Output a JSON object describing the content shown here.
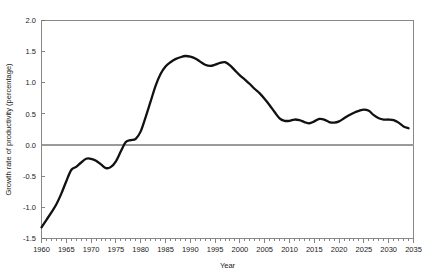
{
  "chart_data": {
    "type": "line",
    "title": "",
    "xlabel": "Year",
    "ylabel": "Growth rate of productivity (percentage)",
    "xlim": [
      1960,
      2035
    ],
    "ylim": [
      -1.5,
      2.0
    ],
    "grid": false,
    "legend": null,
    "xticks": [
      1960,
      1965,
      1970,
      1975,
      1980,
      1985,
      1990,
      1995,
      2000,
      2005,
      2010,
      2015,
      2020,
      2025,
      2030,
      2035
    ],
    "xtick_labels": [
      "1960",
      "1965",
      "1970",
      "1975",
      "1980",
      "1985",
      "1990",
      "1995",
      "2000",
      "2005",
      "2010",
      "2015",
      "2020",
      "2025",
      "2030",
      "2035"
    ],
    "xtick_minor_step": 1,
    "yticks": [
      -1.5,
      -1.0,
      -0.5,
      0.0,
      0.5,
      1.0,
      1.5,
      2.0
    ],
    "ytick_labels": [
      "-1.5",
      "-1.0",
      "-0.5",
      "0.0",
      "0.5",
      "1.0",
      "1.5",
      "2.0"
    ],
    "zero_reference_line": 0.0,
    "line_color": "#111111",
    "series": [
      {
        "name": "Growth rate of productivity",
        "x": [
          1960,
          1961,
          1962,
          1963,
          1964,
          1965,
          1966,
          1967,
          1968,
          1969,
          1970,
          1971,
          1972,
          1973,
          1974,
          1975,
          1976,
          1977,
          1978,
          1979,
          1980,
          1981,
          1982,
          1983,
          1984,
          1985,
          1986,
          1987,
          1988,
          1989,
          1990,
          1991,
          1992,
          1993,
          1994,
          1995,
          1996,
          1997,
          1998,
          1999,
          2000,
          2001,
          2002,
          2003,
          2004,
          2005,
          2006,
          2007,
          2008,
          2009,
          2010,
          2011,
          2012,
          2013,
          2014,
          2015,
          2016,
          2017,
          2018,
          2019,
          2020,
          2021,
          2022,
          2023,
          2024,
          2025,
          2026,
          2027,
          2028,
          2029,
          2030,
          2031,
          2032,
          2033,
          2034
        ],
        "values": [
          -1.32,
          -1.2,
          -1.08,
          -0.95,
          -0.78,
          -0.58,
          -0.4,
          -0.35,
          -0.28,
          -0.22,
          -0.22,
          -0.25,
          -0.31,
          -0.37,
          -0.35,
          -0.26,
          -0.1,
          0.05,
          0.08,
          0.1,
          0.22,
          0.45,
          0.7,
          0.95,
          1.14,
          1.26,
          1.33,
          1.38,
          1.41,
          1.43,
          1.42,
          1.39,
          1.34,
          1.29,
          1.27,
          1.29,
          1.32,
          1.33,
          1.28,
          1.2,
          1.12,
          1.05,
          0.98,
          0.9,
          0.83,
          0.74,
          0.64,
          0.53,
          0.43,
          0.39,
          0.39,
          0.41,
          0.4,
          0.37,
          0.35,
          0.38,
          0.42,
          0.41,
          0.37,
          0.36,
          0.38,
          0.43,
          0.48,
          0.52,
          0.55,
          0.57,
          0.55,
          0.48,
          0.43,
          0.41,
          0.41,
          0.4,
          0.36,
          0.3,
          0.27
        ]
      }
    ]
  }
}
